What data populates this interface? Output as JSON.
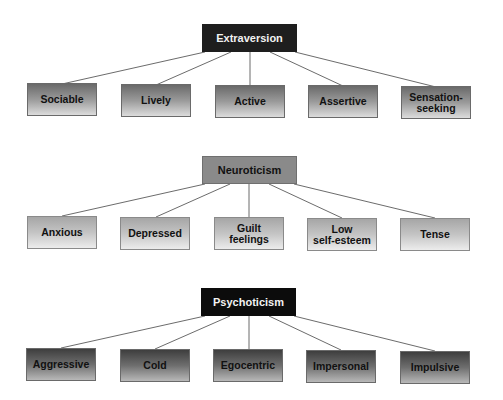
{
  "diagram": {
    "groups": [
      {
        "id": "extraversion",
        "label": "Extraversion",
        "colors": {
          "parent_bg": "#1e1e1e",
          "parent_text": "#f2f2f2",
          "child_gradient_top": "#6a6a6a",
          "child_gradient_bottom": "#dcdcdc"
        },
        "children": [
          "Sociable",
          "Lively",
          "Active",
          "Assertive",
          "Sensation-\nseeking"
        ]
      },
      {
        "id": "neuroticism",
        "label": "Neuroticism",
        "colors": {
          "parent_bg": "#8a8a8a",
          "parent_text": "#111111",
          "child_gradient_top": "#a6a6a6",
          "child_gradient_bottom": "#ececec"
        },
        "children": [
          "Anxious",
          "Depressed",
          "Guilt\nfeelings",
          "Low\nself-esteem",
          "Tense"
        ]
      },
      {
        "id": "psychoticism",
        "label": "Psychoticism",
        "colors": {
          "parent_bg": "#0c0c0c",
          "parent_text": "#f2f2f2",
          "child_gradient_top": "#3e3e3e",
          "child_gradient_bottom": "#b8b8b8"
        },
        "children": [
          "Aggressive",
          "Cold",
          "Egocentric",
          "Impersonal",
          "Impulsive"
        ]
      }
    ],
    "line_color": "#5a5a5a"
  }
}
